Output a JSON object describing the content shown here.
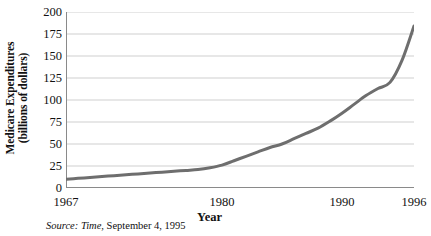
{
  "chart_data": {
    "type": "line",
    "title": "",
    "xlabel": "Year",
    "ylabel_line1": "Medicare Expenditures",
    "ylabel_line2": "(billions of dollars)",
    "ylabel": "Medicare Expenditures (billions of dollars)",
    "xlim": [
      1967,
      1996
    ],
    "ylim": [
      0,
      200
    ],
    "ytick_values": [
      0,
      25,
      50,
      75,
      100,
      125,
      150,
      175,
      200
    ],
    "ytick_labels": [
      "0",
      "25",
      "50",
      "75",
      "100",
      "125",
      "150",
      "175",
      "200"
    ],
    "xtick_values": [
      1967,
      1980,
      1990,
      1996
    ],
    "xtick_labels": [
      "1967",
      "1980",
      "1990",
      "1996"
    ],
    "xtick_minor_step": 1,
    "grid": "horizontal",
    "legend": "none",
    "line_color": "#6e6e6e",
    "line_width": 3,
    "x": [
      1967,
      1968,
      1969,
      1970,
      1971,
      1972,
      1973,
      1974,
      1975,
      1976,
      1977,
      1978,
      1979,
      1980,
      1981,
      1982,
      1983,
      1984,
      1985,
      1986,
      1987,
      1988,
      1989,
      1990,
      1991,
      1992,
      1993,
      1994,
      1995,
      1996
    ],
    "values": [
      10,
      11,
      12,
      13,
      14,
      15,
      16,
      17,
      18,
      19,
      20,
      21,
      23,
      26,
      31,
      36,
      41,
      46,
      50,
      56,
      62,
      68,
      76,
      85,
      95,
      105,
      113,
      120,
      145,
      184
    ],
    "series": [
      {
        "name": "Medicare Expenditures",
        "values": [
          10,
          11,
          12,
          13,
          14,
          15,
          16,
          17,
          18,
          19,
          20,
          21,
          23,
          26,
          31,
          36,
          41,
          46,
          50,
          56,
          62,
          68,
          76,
          85,
          95,
          105,
          113,
          120,
          145,
          184
        ]
      }
    ]
  },
  "source_note": {
    "prefix": "Source:",
    "publication": "Time",
    "rest": ", September 4, 1995"
  },
  "colors": {
    "line": "#6e6e6e",
    "grid": "#cfcfcf",
    "axis": "#8a8a8a",
    "text": "#111111"
  }
}
